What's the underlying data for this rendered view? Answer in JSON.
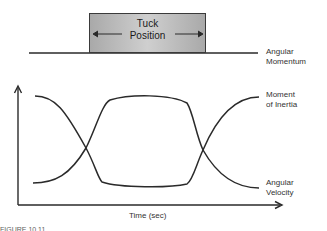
{
  "top_panel": {
    "box_label_line1": "Tuck",
    "box_label_line2": "Position",
    "line_label_line1": "Angular",
    "line_label_line2": "Momentum"
  },
  "bottom_panel": {
    "curve_top_label_line1": "Moment",
    "curve_top_label_line2": "of Inertia",
    "curve_bottom_label_line1": "Angular",
    "curve_bottom_label_line2": "Velocity",
    "x_axis_label": "Time (sec)"
  },
  "caption_fragment": "FIGURE 10.11",
  "colors": {
    "line": "#2a2a2a",
    "box_edge": "#a9a9a9",
    "box_center": "#cfcfcf"
  }
}
